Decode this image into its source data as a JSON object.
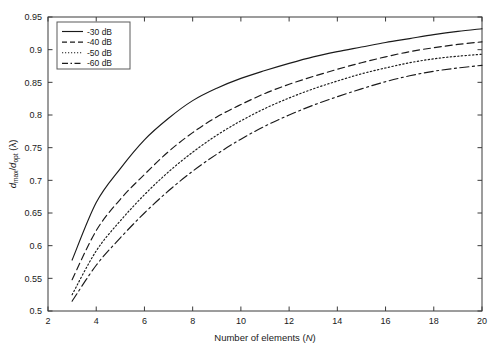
{
  "chart_data": {
    "type": "line",
    "title": "",
    "xlabel": "Number of elements (N)",
    "ylabel": "d_max/d_opt (λ)",
    "ylabel_parts": {
      "d1": "d",
      "sub1": "max",
      "slash": "/",
      "d2": "d",
      "sub2": "opt",
      "unit": "(λ)"
    },
    "xlabel_parts": {
      "text": "Number of elements (",
      "ital": "N",
      "close": ")"
    },
    "xlim": [
      2,
      20
    ],
    "ylim": [
      0.5,
      0.95
    ],
    "xticks": [
      2,
      4,
      6,
      8,
      10,
      12,
      14,
      16,
      18,
      20
    ],
    "xtick_labels": [
      "2",
      "4",
      "6",
      "8",
      "10",
      "12",
      "14",
      "16",
      "18",
      "20"
    ],
    "yticks": [
      0.5,
      0.55,
      0.6,
      0.65,
      0.7,
      0.75,
      0.8,
      0.85,
      0.9,
      0.95
    ],
    "ytick_labels": [
      "0.5",
      "0.55",
      "0.6",
      "0.65",
      "0.7",
      "0.75",
      "0.8",
      "0.85",
      "0.9",
      "0.95"
    ],
    "grid": false,
    "legend_position": "upper-left",
    "x": [
      3,
      4,
      5,
      6,
      7,
      8,
      9,
      10,
      11,
      12,
      13,
      14,
      15,
      16,
      17,
      18,
      19,
      20
    ],
    "series": [
      {
        "name": "-30 dB",
        "style": "solid",
        "dasharray": "none",
        "color": "#1a1a1a",
        "values": [
          0.578,
          0.666,
          0.718,
          0.762,
          0.795,
          0.822,
          0.841,
          0.856,
          0.868,
          0.879,
          0.889,
          0.897,
          0.904,
          0.911,
          0.917,
          0.923,
          0.928,
          0.932
        ]
      },
      {
        "name": "-40 dB",
        "style": "dashed",
        "dasharray": "7,4",
        "color": "#1a1a1a",
        "values": [
          0.548,
          0.623,
          0.671,
          0.709,
          0.744,
          0.773,
          0.797,
          0.816,
          0.833,
          0.847,
          0.859,
          0.87,
          0.88,
          0.889,
          0.897,
          0.903,
          0.908,
          0.912
        ]
      },
      {
        "name": "-50 dB",
        "style": "dotted",
        "dasharray": "1.4,2.3",
        "color": "#1a1a1a",
        "values": [
          0.525,
          0.592,
          0.638,
          0.678,
          0.713,
          0.743,
          0.769,
          0.791,
          0.81,
          0.826,
          0.84,
          0.852,
          0.863,
          0.872,
          0.88,
          0.886,
          0.89,
          0.893
        ]
      },
      {
        "name": "-60 dB",
        "style": "dashdot",
        "dasharray": "9,3.5,2,3.5",
        "color": "#1a1a1a",
        "values": [
          0.515,
          0.57,
          0.612,
          0.65,
          0.684,
          0.714,
          0.74,
          0.763,
          0.783,
          0.8,
          0.815,
          0.828,
          0.84,
          0.851,
          0.86,
          0.867,
          0.872,
          0.876
        ]
      }
    ],
    "legend_entries": [
      "-30 dB",
      "-40 dB",
      "-50 dB",
      "-60 dB"
    ]
  }
}
